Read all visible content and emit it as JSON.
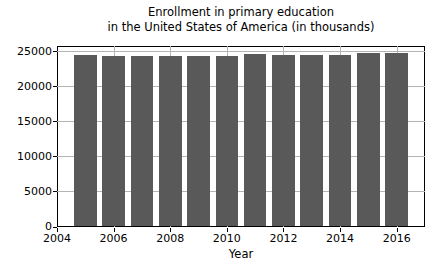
{
  "chart_data": {
    "type": "bar",
    "title": "Enrollment in primary education in the United States of America (in thousands)",
    "title_lines": [
      "Enrollment in primary education",
      "in the United States of America (in thousands)"
    ],
    "xlabel": "Year",
    "ylabel": "",
    "categories": [
      2005,
      2006,
      2007,
      2008,
      2009,
      2010,
      2011,
      2012,
      2013,
      2014,
      2015,
      2016
    ],
    "values": [
      24455,
      24319,
      24297,
      24343,
      24360,
      24393,
      24670,
      24532,
      24527,
      24477,
      24690,
      24767
    ],
    "series_name": "Enrollment (thousands)",
    "bar_width_years": 0.8,
    "xlim": [
      2004,
      2017
    ],
    "ylim": [
      0,
      25750
    ],
    "xticks": [
      2004,
      2006,
      2008,
      2010,
      2012,
      2014,
      2016
    ],
    "yticks": [
      0,
      5000,
      10000,
      15000,
      20000,
      25000
    ],
    "grid": true,
    "legend": "none",
    "colors": {
      "bar": "#595959",
      "grid": "#b4b4b4",
      "axis": "#000000",
      "text": "#000000",
      "background": "#ffffff"
    }
  }
}
